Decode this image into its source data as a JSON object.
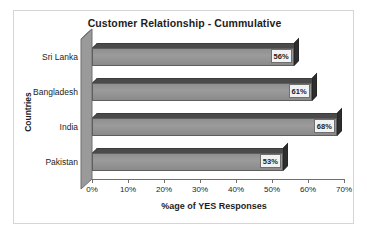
{
  "chart_data": {
    "type": "bar",
    "orientation": "horizontal",
    "title": "Customer Relationship - Cummulative",
    "xlabel": "%age of YES Responses",
    "ylabel": "Countries",
    "categories": [
      "Sri Lanka",
      "Bangladesh",
      "India",
      "Pakistan"
    ],
    "values": [
      56,
      61,
      68,
      53
    ],
    "data_labels": [
      "56%",
      "61%",
      "68%",
      "53%"
    ],
    "xlim": [
      0,
      70
    ],
    "xticks": [
      0,
      10,
      20,
      30,
      40,
      50,
      60,
      70
    ],
    "xtick_labels": [
      "0%",
      "10%",
      "20%",
      "30%",
      "40%",
      "50%",
      "60%",
      "70%"
    ],
    "grid": false,
    "legend": false,
    "style": "3d-grayscale",
    "colors": {
      "bar_front": "#9b9b9b",
      "bar_top": "#4a4a4a",
      "bar_cap": "#2e2e2e",
      "axis_wall": "#9a9a9a",
      "axis_line": "#6f6f6f",
      "label_box": "#f2f2f2",
      "text": "#1d1d1d",
      "frame_border": "#d5d5d5",
      "background": "#ffffff"
    }
  }
}
